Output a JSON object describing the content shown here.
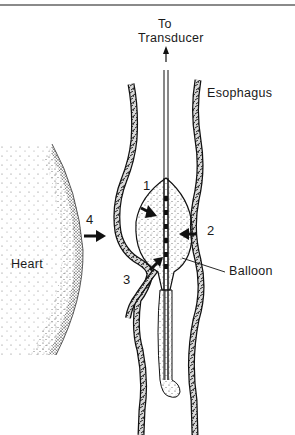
{
  "figure": {
    "type": "anatomical-diagram"
  },
  "labels": {
    "to_transducer_line1": "To",
    "to_transducer_line2": "Transducer",
    "esophagus": "Esophagus",
    "heart": "Heart",
    "balloon": "Balloon"
  },
  "arrows": [
    {
      "id": "1",
      "label": "1"
    },
    {
      "id": "2",
      "label": "2"
    },
    {
      "id": "3",
      "label": "3"
    },
    {
      "id": "4",
      "label": "4"
    }
  ],
  "colors": {
    "ink": "#1a1a1a",
    "stipple": "#555555",
    "background": "#ffffff",
    "top_rule": "#8a8a8a"
  }
}
